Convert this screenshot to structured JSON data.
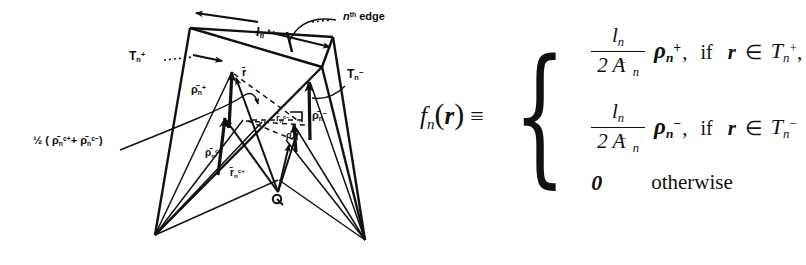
{
  "figure": {
    "type": "rwg-basis-function-geometry",
    "diagram": {
      "labels": {
        "edge": "n",
        "edge_sup": "th",
        "edge_word": "edge",
        "edge_length": "l",
        "edge_length_sub": "n",
        "triangle_plus": "T",
        "triangle_plus_sub": "n",
        "triangle_plus_sup": "+",
        "triangle_minus": "T",
        "triangle_minus_sub": "n",
        "triangle_minus_sup": "−",
        "rho_plus": "ρ̄",
        "rho_plus_sub": "n",
        "rho_plus_sup": "+",
        "rho_minus": "ρ̄",
        "rho_minus_sub": "n",
        "rho_minus_sup": "−",
        "rho_c_plus": "ρ̄",
        "rho_c_plus_sub": "n",
        "rho_c_plus_sup": "c+",
        "rho_c_minus": "ρ̄",
        "rho_c_minus_sub": "n",
        "rho_c_minus_sup": "c−",
        "r_vector": "r̄",
        "r_c_plus": "r̄",
        "r_c_plus_sub": "n",
        "r_c_plus_sup": "c+",
        "r_c_minus": "r̄",
        "r_c_minus_sub": "n",
        "r_c_minus_sup": "c−",
        "origin": "O",
        "midpoint_expr": "½ ( ρ̄",
        "midpoint_sub1": "n",
        "midpoint_sup1": "c+",
        "midpoint_plus": "+",
        "midpoint_rho2": "ρ̄",
        "midpoint_sub2": "n",
        "midpoint_sup2": "c−",
        "midpoint_close": ")"
      }
    },
    "equation": {
      "lhs_f": "f",
      "lhs_sub": "n",
      "lhs_open": "(",
      "lhs_r": "r",
      "lhs_close": ")",
      "lhs_equiv": "≡",
      "cases": [
        {
          "num": "l",
          "num_sub": "n",
          "den_coef": "2 A",
          "den_sub": "n",
          "den_sup": "+",
          "rho": "ρ",
          "rho_sub": "n",
          "rho_sup": "+",
          "comma": ",",
          "if": "if",
          "r": "r",
          "member": "∈",
          "T": "T",
          "T_sub": "n",
          "T_sup": "+",
          "trail": ","
        },
        {
          "num": "l",
          "num_sub": "n",
          "den_coef": "2 A",
          "den_sub": "n",
          "den_sup": "−",
          "rho": "ρ",
          "rho_sub": "n",
          "rho_sup": "−",
          "comma": ",",
          "if": "if",
          "r": "r",
          "member": "∈",
          "T": "T",
          "T_sub": "n",
          "T_sup": "−",
          "trail": ""
        },
        {
          "zero": "0",
          "otherwise": "otherwise"
        }
      ]
    }
  },
  "colors": {
    "ink": "#111111",
    "background": "#ffffff"
  }
}
